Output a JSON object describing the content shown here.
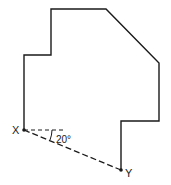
{
  "diagram": {
    "type": "geometry-figure",
    "shape": "irregular polygon (floor plan)",
    "stroke_color": "#1a1a1a",
    "outline_points": [
      [
        51,
        9
      ],
      [
        106,
        9
      ],
      [
        159,
        63
      ],
      [
        159,
        121
      ],
      [
        121,
        121
      ],
      [
        121,
        170
      ],
      [
        24,
        130
      ],
      [
        24,
        55
      ],
      [
        51,
        55
      ]
    ],
    "outline_path_points": [
      [
        24,
        130
      ],
      [
        24,
        55
      ],
      [
        51,
        55
      ],
      [
        51,
        9
      ],
      [
        106,
        9
      ],
      [
        159,
        63
      ],
      [
        159,
        121
      ],
      [
        121,
        121
      ],
      [
        121,
        170
      ]
    ],
    "points": {
      "X": {
        "label": "X",
        "x": 24,
        "y": 130
      },
      "Y": {
        "label": "Y",
        "x": 121,
        "y": 170
      }
    },
    "dashed_lines": [
      {
        "name": "horizontal-reference",
        "from": [
          24,
          130
        ],
        "to": [
          66,
          130
        ]
      },
      {
        "name": "XY",
        "from": [
          24,
          130
        ],
        "to": [
          121,
          170
        ]
      }
    ],
    "angle": {
      "label": "20°",
      "vertex": "X"
    }
  }
}
